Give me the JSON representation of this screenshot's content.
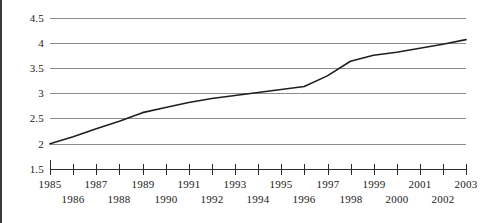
{
  "chart_data": {
    "type": "line",
    "title": "",
    "subtitle": "",
    "xlabel": "",
    "ylabel": "",
    "xlim": [
      1985,
      2003
    ],
    "ylim": [
      1.5,
      4.5
    ],
    "grid": true,
    "legend": null,
    "legend_position": "none",
    "x": [
      1985,
      1986,
      1987,
      1988,
      1989,
      1990,
      1991,
      1992,
      1993,
      1994,
      1995,
      1996,
      1997,
      1998,
      1999,
      2000,
      2001,
      2002,
      2003
    ],
    "y_ticks": [
      1.5,
      2,
      2.5,
      3,
      3.5,
      4,
      4.5
    ],
    "y_tick_labels": [
      "1.5",
      "2",
      "2.5",
      "3",
      "3.5",
      "4",
      "4.5"
    ],
    "x_tick_labels_top": [
      "1985",
      "1987",
      "1989",
      "1991",
      "1993",
      "1995",
      "1997",
      "1999",
      "2001",
      "2003"
    ],
    "x_tick_labels_bottom": [
      "1986",
      "1988",
      "1990",
      "1992",
      "1994",
      "1996",
      "1998",
      "2000",
      "2002"
    ],
    "series": [
      {
        "name": "series-1",
        "color": "#1f1f1f",
        "values": [
          2.0,
          2.14,
          2.3,
          2.45,
          2.62,
          2.72,
          2.82,
          2.9,
          2.96,
          3.02,
          3.08,
          3.14,
          3.35,
          3.64,
          3.76,
          3.82,
          3.9,
          3.98,
          4.07
        ]
      }
    ]
  },
  "style": {
    "background_color": "#ffffff",
    "gridline_color": "#8c8c8c",
    "axis_color": "#2b2b2b",
    "text_color": "#1a1a1a",
    "series_color": "#1f1f1f"
  }
}
